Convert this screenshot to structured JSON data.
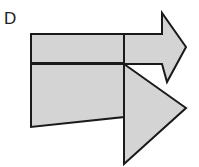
{
  "figure": {
    "option_label": "D",
    "background_color": "#ffffff",
    "fill_color": "#d4d4d4",
    "stroke_color": "#1a1a1a",
    "stroke_width": 2,
    "width": 199,
    "height": 167,
    "shapes": {
      "upper_arrow": {
        "name": "right-pointing-arrow",
        "points": "31,34 162,34 162,13 186,47 162,82 167,82 162,64 31,64"
      },
      "arrow_body_top": {
        "name": "arrow-shaft-upper-rectangle",
        "points": "31,34 124,34 124,63 31,63"
      },
      "arrow_head": {
        "name": "arrow-head-chevron",
        "points": "124,34 162,34 162,13 186,47 167,82 162,64 124,64"
      },
      "lower_quadrilateral": {
        "name": "lower-left-quadrilateral",
        "points": "31,64 124,64 124,117 31,127"
      },
      "lower_triangle": {
        "name": "lower-right-triangle",
        "points": "124,64 186,108 124,164"
      },
      "divider_middle": {
        "name": "horizontal-divider",
        "points": "31,63 124,63"
      },
      "divider_vertical": {
        "name": "vertical-divider",
        "points": "124,34 124,164"
      }
    }
  }
}
